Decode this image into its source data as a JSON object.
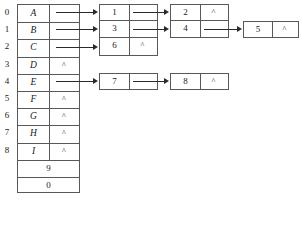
{
  "diagram": {
    "type": "adjacency-list",
    "null_symbol": "^",
    "colors": {
      "border": "#58585a",
      "arrow": "#2b2b2b",
      "text": "#1a1a1a",
      "background": "#ffffff"
    },
    "vertex_table": {
      "indices": [
        "0",
        "1",
        "2",
        "3",
        "4",
        "5",
        "6",
        "7",
        "8"
      ],
      "rows": [
        {
          "index": "0",
          "key": "A",
          "pointer": "",
          "has_link": true
        },
        {
          "index": "1",
          "key": "B",
          "pointer": "",
          "has_link": true
        },
        {
          "index": "2",
          "key": "C",
          "pointer": "",
          "has_link": true
        },
        {
          "index": "3",
          "key": "D",
          "pointer": "^",
          "has_link": false
        },
        {
          "index": "4",
          "key": "E",
          "pointer": "",
          "has_link": true
        },
        {
          "index": "5",
          "key": "F",
          "pointer": "^",
          "has_link": false
        },
        {
          "index": "6",
          "key": "G",
          "pointer": "^",
          "has_link": false
        },
        {
          "index": "7",
          "key": "H",
          "pointer": "^",
          "has_link": false
        },
        {
          "index": "8",
          "key": "I",
          "pointer": "^",
          "has_link": false
        }
      ],
      "footer_rows": [
        {
          "value": "9"
        },
        {
          "value": "0"
        }
      ]
    },
    "lists": [
      {
        "from_index": "0",
        "from_key": "A",
        "nodes": [
          {
            "value": "1",
            "pointer": "",
            "has_link": true
          },
          {
            "value": "2",
            "pointer": "^",
            "has_link": false
          }
        ]
      },
      {
        "from_index": "1",
        "from_key": "B",
        "nodes": [
          {
            "value": "3",
            "pointer": "",
            "has_link": true
          },
          {
            "value": "4",
            "pointer": "",
            "has_link": true
          },
          {
            "value": "5",
            "pointer": "^",
            "has_link": false
          }
        ]
      },
      {
        "from_index": "2",
        "from_key": "C",
        "nodes": [
          {
            "value": "6",
            "pointer": "^",
            "has_link": false
          }
        ]
      },
      {
        "from_index": "4",
        "from_key": "E",
        "nodes": [
          {
            "value": "7",
            "pointer": "",
            "has_link": true
          },
          {
            "value": "8",
            "pointer": "^",
            "has_link": false
          }
        ]
      }
    ]
  }
}
